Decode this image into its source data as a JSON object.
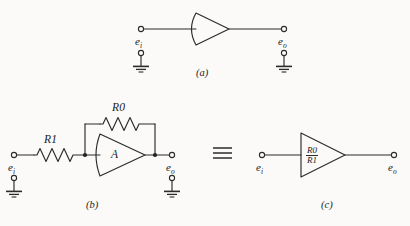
{
  "figure": {
    "background_color": "#fbfaf8",
    "stroke_color": "#2b2b2b",
    "panels": [
      {
        "caption": "(a)",
        "input_label": "e",
        "input_sub": "i",
        "output_label": "e",
        "output_sub": "o",
        "amplifier_label": "",
        "description": "single amplifier block with curved left edge"
      },
      {
        "caption": "(b)",
        "input_label": "e",
        "input_sub": "i",
        "output_label": "e",
        "output_sub": "o",
        "amplifier_label": "A",
        "series_resistor": "R1",
        "feedback_resistor": "R0",
        "description": "inverting amplifier with input resistor R1 and feedback resistor R0"
      },
      {
        "caption": "(c)",
        "input_label": "e",
        "input_sub": "i",
        "output_label": "e",
        "output_sub": "o",
        "gain_numerator": "R0",
        "gain_denominator": "R1",
        "description": "equivalent amplifier block with gain R0 over R1"
      }
    ],
    "equivalence_symbol": "≡",
    "labels": {
      "panel_a_input": "e",
      "panel_a_input_sub": "i",
      "panel_a_output": "e",
      "panel_a_output_sub": "o",
      "panel_a_caption": "(a)",
      "panel_b_input": "e",
      "panel_b_input_sub": "i",
      "panel_b_output": "e",
      "panel_b_output_sub": "o",
      "panel_b_caption": "(b)",
      "panel_b_r1": "R1",
      "panel_b_r0": "R0",
      "panel_b_amp": "A",
      "panel_c_input": "e",
      "panel_c_input_sub": "i",
      "panel_c_output": "e",
      "panel_c_output_sub": "o",
      "panel_c_caption": "(c)",
      "panel_c_num": "R0",
      "panel_c_den": "R1"
    }
  }
}
